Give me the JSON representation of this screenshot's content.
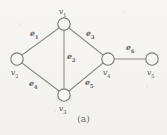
{
  "figure": {
    "caption": "(a)",
    "type": "undirected-graph",
    "background_color": "#f4f3f1",
    "ink_color": "#8d8b88",
    "vertex_fill": "#f7f6f4",
    "vertices": [
      {
        "id": "v1",
        "label": "v",
        "subscript": "1",
        "cx": 64,
        "cy": 24,
        "r": 6.2,
        "label_x": 59,
        "label_y": 8,
        "label_pos": "above"
      },
      {
        "id": "v2",
        "label": "v",
        "subscript": "2",
        "cx": 17,
        "cy": 59,
        "r": 6.2,
        "label_x": 11,
        "label_y": 69,
        "label_pos": "below-left"
      },
      {
        "id": "v3",
        "label": "v",
        "subscript": "3",
        "cx": 64,
        "cy": 95,
        "r": 6.2,
        "label_x": 59,
        "label_y": 105,
        "label_pos": "below"
      },
      {
        "id": "v4",
        "label": "v",
        "subscript": "4",
        "cx": 108,
        "cy": 59,
        "r": 6.2,
        "label_x": 103,
        "label_y": 69,
        "label_pos": "below"
      },
      {
        "id": "v5",
        "label": "v",
        "subscript": "5",
        "cx": 152,
        "cy": 59,
        "r": 6.2,
        "label_x": 147,
        "label_y": 69,
        "label_pos": "below"
      }
    ],
    "edges": [
      {
        "id": "e1",
        "label": "e",
        "subscript": "1",
        "from": "v1",
        "to": "v2",
        "x1": 59,
        "y1": 28,
        "x2": 22,
        "y2": 55,
        "label_x": 30,
        "label_y": 30
      },
      {
        "id": "e2",
        "label": "e",
        "subscript": "2",
        "from": "v1",
        "to": "v3",
        "x1": 64,
        "y1": 30,
        "x2": 64,
        "y2": 89,
        "label_x": 67,
        "label_y": 53
      },
      {
        "id": "e3",
        "label": "e",
        "subscript": "3",
        "from": "v1",
        "to": "v4",
        "x1": 69,
        "y1": 28,
        "x2": 103,
        "y2": 55,
        "label_x": 86,
        "label_y": 30
      },
      {
        "id": "e4",
        "label": "e",
        "subscript": "4",
        "from": "v2",
        "to": "v3",
        "x1": 22,
        "y1": 63,
        "x2": 59,
        "y2": 91,
        "label_x": 29,
        "label_y": 80
      },
      {
        "id": "e5",
        "label": "e",
        "subscript": "5",
        "from": "v3",
        "to": "v4",
        "x1": 69,
        "y1": 91,
        "x2": 103,
        "y2": 63,
        "label_x": 85,
        "label_y": 79
      },
      {
        "id": "e6",
        "label": "e",
        "subscript": "6",
        "from": "v4",
        "to": "v5",
        "x1": 114,
        "y1": 59,
        "x2": 146,
        "y2": 59,
        "label_x": 126,
        "label_y": 44
      }
    ]
  }
}
